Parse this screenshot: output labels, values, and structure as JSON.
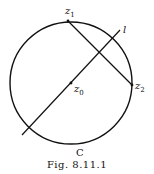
{
  "figure": {
    "caption": "Fig. 8.11.1",
    "labels": {
      "z1": {
        "base": "z",
        "sub": "1"
      },
      "z2": {
        "base": "z",
        "sub": "2"
      },
      "z0": {
        "base": "z",
        "sub": "0"
      },
      "l": "l",
      "C": "C"
    },
    "circle": {
      "cx": 71,
      "cy": 83,
      "r": 61
    },
    "points": {
      "z1": [
        68,
        21
      ],
      "z2": [
        132,
        85
      ],
      "z0": [
        71,
        83
      ]
    },
    "line_l": [
      [
        22,
        135
      ],
      [
        120,
        30
      ]
    ],
    "stroke_color": "#111111"
  }
}
